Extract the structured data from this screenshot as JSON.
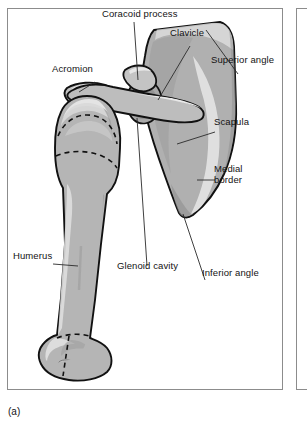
{
  "figure": {
    "caption": "(a)",
    "panel_label": "a",
    "view": "anterior view of right shoulder girdle"
  },
  "labels": {
    "coracoid_process": "Coracoid process",
    "clavicle": "Clavicle",
    "superior_angle": "Superior angle",
    "acromion": "Acromion",
    "scapula": "Scapula",
    "medial_border": "Medial\nborder",
    "humerus": "Humerus",
    "glenoid_cavity": "Glenoid cavity",
    "inferior_angle": "Inferior angle"
  },
  "colors": {
    "bone_fill": "#b3b3b3",
    "bone_fill_light": "#cfcfcf",
    "bone_highlight": "#e2e2e2",
    "bone_shadow": "#9a9a9a",
    "outline": "#111111",
    "dashed_line": "#111111",
    "leader_line": "#2a2a2a",
    "frame": "#8c8c8c",
    "background": "#ffffff",
    "text": "#131313"
  },
  "structures": [
    {
      "name": "humerus",
      "type": "long-bone",
      "features": [
        "head",
        "greater tubercle",
        "shaft",
        "medial epicondyle",
        "lateral epicondyle",
        "capitulum",
        "trochlea",
        "epiphyseal lines"
      ]
    },
    {
      "name": "scapula",
      "type": "flat-bone",
      "features": [
        "superior angle",
        "medial border",
        "lateral border",
        "inferior angle",
        "glenoid cavity",
        "coracoid process",
        "acromion",
        "subscapular fossa"
      ]
    },
    {
      "name": "clavicle",
      "type": "long-bone",
      "features": [
        "sternal end",
        "acromial end",
        "shaft"
      ]
    }
  ]
}
